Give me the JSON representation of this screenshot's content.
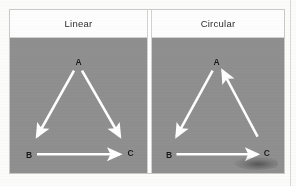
{
  "figure": {
    "type": "directed-graph-comparison",
    "background_color": "#8f8f8f",
    "arrow_color": "#ffffff",
    "label_color": "#161616",
    "panels": [
      {
        "id": "linear",
        "title": "Linear",
        "nodes": [
          {
            "id": "A",
            "label": "A",
            "x": 50,
            "y": 20
          },
          {
            "id": "B",
            "label": "B",
            "x": 14,
            "y": 83
          },
          {
            "id": "C",
            "label": "C",
            "x": 86,
            "y": 83
          }
        ],
        "edges": [
          {
            "from": "A",
            "to": "B",
            "direction": "down-left"
          },
          {
            "from": "A",
            "to": "C",
            "direction": "down-right"
          },
          {
            "from": "B",
            "to": "C",
            "direction": "right"
          }
        ]
      },
      {
        "id": "circular",
        "title": "Circular",
        "nodes": [
          {
            "id": "A",
            "label": "A",
            "x": 50,
            "y": 20
          },
          {
            "id": "B",
            "label": "B",
            "x": 14,
            "y": 83
          },
          {
            "id": "C",
            "label": "C",
            "x": 86,
            "y": 83
          }
        ],
        "edges": [
          {
            "from": "A",
            "to": "B",
            "direction": "down-left"
          },
          {
            "from": "B",
            "to": "C",
            "direction": "right"
          },
          {
            "from": "C",
            "to": "A",
            "direction": "up-left"
          }
        ]
      }
    ]
  }
}
